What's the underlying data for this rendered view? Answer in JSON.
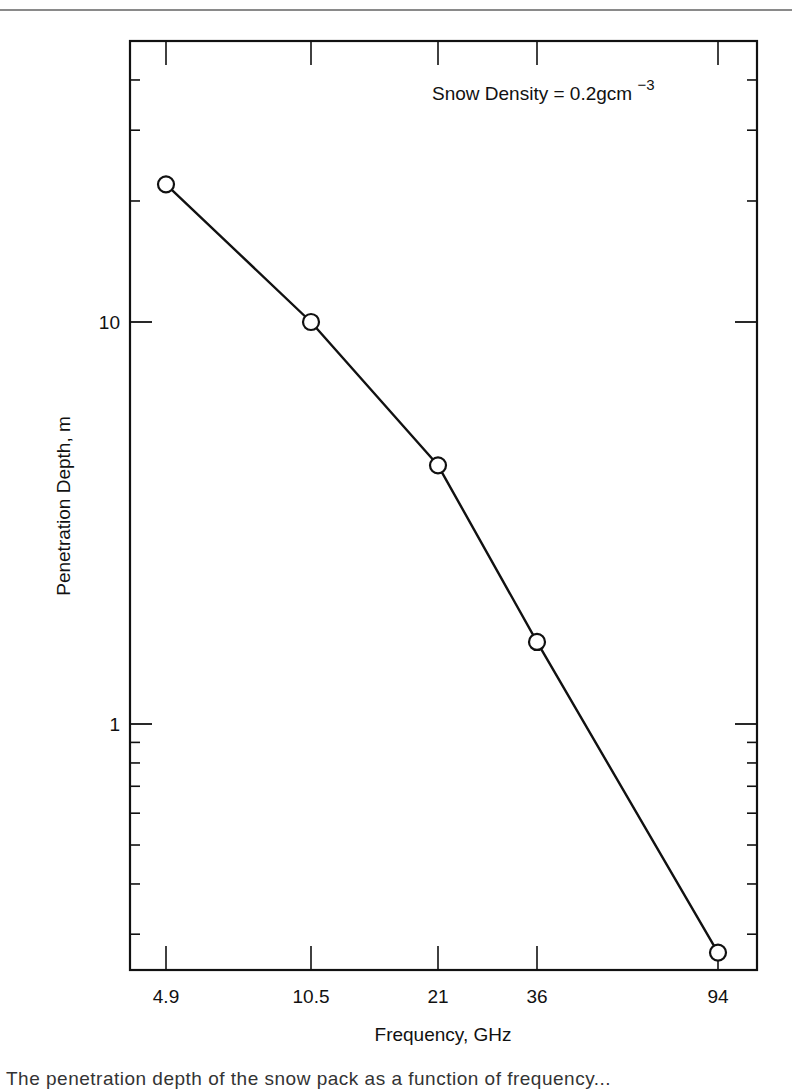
{
  "chart_data": {
    "type": "line",
    "title": "",
    "annotation": {
      "text": "Snow Density = 0.2gcm",
      "superscript": "−3",
      "full": "Snow Density = 0.2 g cm^-3"
    },
    "xlabel": "Frequency, GHz",
    "ylabel": "Penetration Depth, m",
    "x_scale": "log",
    "y_scale": "log",
    "x_ticks": [
      4.9,
      10.5,
      21,
      36,
      94
    ],
    "x_tick_labels": [
      "4.9",
      "10.5",
      "21",
      "36",
      "94"
    ],
    "y_major_ticks": [
      1,
      10
    ],
    "y_tick_labels": [
      "1",
      "10"
    ],
    "y_minor_ticks": [
      0.3,
      0.4,
      0.5,
      0.6,
      0.7,
      0.8,
      0.9,
      20,
      30,
      40
    ],
    "ylim": [
      0.244,
      50
    ],
    "grid": false,
    "legend": null,
    "series": [
      {
        "name": "Penetration depth",
        "marker": "open-circle",
        "x": [
          4.9,
          10.5,
          21,
          36,
          94
        ],
        "y": [
          22,
          10,
          4.4,
          1.6,
          0.27
        ]
      }
    ]
  },
  "layout": {
    "frame": {
      "left": 130,
      "right": 757,
      "top": 41,
      "bottom": 970
    },
    "x_tick_px": [
      166,
      311,
      438,
      537,
      718
    ],
    "y_px_of_1": 724,
    "y_px_of_10": 322
  },
  "caption": {
    "text": "The penetration depth of the snow pack as a function of frequency..."
  },
  "colors": {
    "ink": "#111111",
    "rule": "#8a8a8a",
    "background": "#ffffff"
  }
}
